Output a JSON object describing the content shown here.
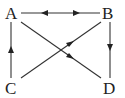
{
  "diagram": {
    "type": "directed-graph",
    "nodes": [
      {
        "id": "A",
        "label": "A",
        "x": 12,
        "y": 13
      },
      {
        "id": "B",
        "label": "B",
        "x": 109,
        "y": 13
      },
      {
        "id": "C",
        "label": "C",
        "x": 12,
        "y": 88
      },
      {
        "id": "D",
        "label": "D",
        "x": 110,
        "y": 88
      }
    ],
    "edges": [
      {
        "from": "A",
        "to": "B",
        "direction": "bidirectional",
        "description": "A and B point to each other"
      },
      {
        "from": "B",
        "to": "D",
        "direction": "forward"
      },
      {
        "from": "C",
        "to": "A",
        "direction": "forward"
      },
      {
        "from": "A",
        "to": "D",
        "direction": "forward"
      },
      {
        "from": "C",
        "to": "B",
        "direction": "forward"
      }
    ],
    "colors": {
      "stroke": "#333333",
      "text": "#222222",
      "background": "#ffffff"
    }
  }
}
